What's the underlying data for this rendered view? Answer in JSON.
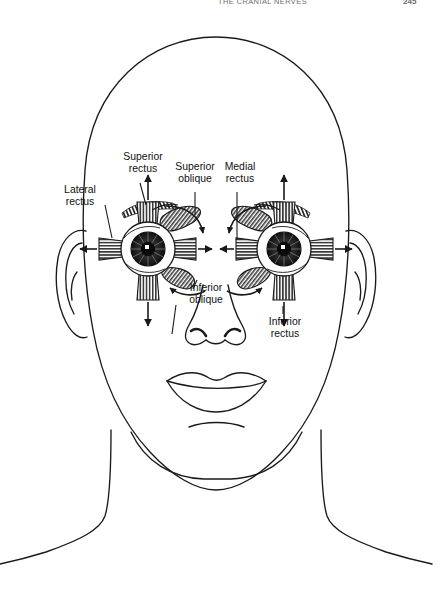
{
  "running_head": {
    "title": "THE CRANIAL NERVES",
    "folio": "245"
  },
  "figure": {
    "ink_color": "#1a1a1a",
    "background_color": "#ffffff"
  },
  "labels": {
    "lateral_rectus": {
      "line1": "Lateral",
      "line2": "rectus"
    },
    "superior_rectus": {
      "line1": "Superior",
      "line2": "rectus"
    },
    "superior_oblique": {
      "line1": "Superior",
      "line2": "oblique"
    },
    "medial_rectus": {
      "line1": "Medial",
      "line2": "rectus"
    },
    "inferior_oblique": {
      "line1": "Inferior",
      "line2": "oblique"
    },
    "inferior_rectus": {
      "line1": "Inferior",
      "line2": "rectus"
    }
  },
  "anatomy_parts": [
    "cranium-outline",
    "left-ear",
    "right-ear",
    "nose",
    "upper-lip",
    "lower-lip",
    "chin-crease",
    "neck",
    "shoulders",
    "left-eye",
    "right-eye",
    "left-eyebrow",
    "right-eyebrow"
  ],
  "muscle_arrows": [
    {
      "name": "left-superior-rectus-arrow",
      "direction": "up"
    },
    {
      "name": "left-inferior-rectus-arrow",
      "direction": "down"
    },
    {
      "name": "left-lateral-rectus-arrow",
      "direction": "left"
    },
    {
      "name": "left-medial-rectus-arrow",
      "direction": "right"
    },
    {
      "name": "right-superior-rectus-arrow",
      "direction": "up"
    },
    {
      "name": "right-inferior-rectus-arrow",
      "direction": "down"
    },
    {
      "name": "right-lateral-rectus-arrow",
      "direction": "right"
    },
    {
      "name": "right-medial-rectus-arrow",
      "direction": "left"
    },
    {
      "name": "left-superior-oblique-arrow",
      "direction": "curved-down"
    },
    {
      "name": "left-inferior-oblique-arrow",
      "direction": "curved-up"
    },
    {
      "name": "right-superior-oblique-arrow",
      "direction": "curved-down"
    },
    {
      "name": "right-inferior-oblique-arrow",
      "direction": "curved-up"
    }
  ]
}
